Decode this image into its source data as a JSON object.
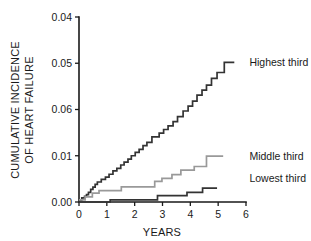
{
  "chart_data": {
    "type": "line",
    "title": "",
    "subtitle": "",
    "xlabel": "YEARS",
    "ylabel": "CUMULATIVE INCIDENCE OF HEART FAILURE",
    "ylabel_line1": "CUMULATIVE INCIDENCE",
    "ylabel_line2": "OF HEART FAILURE",
    "grid": false,
    "legend_position": "inline-right-of-curve-end",
    "step_style": "post",
    "xlim": [
      0,
      6
    ],
    "xticks": [
      0,
      1,
      2,
      3,
      4,
      5,
      6
    ],
    "xticklabels": [
      "0",
      "1",
      "2",
      "3",
      "4",
      "5",
      "6"
    ],
    "yticklabels_bottom_to_top": [
      "0.00",
      "0.01",
      "0.06",
      "0.05",
      "0.04"
    ],
    "yticklabels_top_to_bottom": [
      "0.04",
      "0.05",
      "0.06",
      "0.01",
      "0.00"
    ],
    "ytick_positions_fraction_bottom_to_top": [
      0.0,
      0.25,
      0.5,
      0.75,
      1.0
    ],
    "ytick_value_fraction": {
      "0.00": 0.0,
      "0.01": 0.25,
      "0.06": 0.5,
      "0.05": 0.75,
      "0.04": 1.0
    },
    "series": [
      {
        "name": "Highest third",
        "label": "Highest third",
        "color": "#333333",
        "label_x_years": 6.05,
        "label_y_fraction": 0.755,
        "points_years_fraction": [
          [
            0.0,
            0.01
          ],
          [
            0.1,
            0.01
          ],
          [
            0.1,
            0.022
          ],
          [
            0.2,
            0.022
          ],
          [
            0.2,
            0.03
          ],
          [
            0.27,
            0.03
          ],
          [
            0.27,
            0.04
          ],
          [
            0.34,
            0.04
          ],
          [
            0.34,
            0.052
          ],
          [
            0.42,
            0.052
          ],
          [
            0.42,
            0.068
          ],
          [
            0.5,
            0.068
          ],
          [
            0.5,
            0.08
          ],
          [
            0.58,
            0.08
          ],
          [
            0.58,
            0.095
          ],
          [
            0.66,
            0.095
          ],
          [
            0.66,
            0.108
          ],
          [
            0.8,
            0.108
          ],
          [
            0.8,
            0.122
          ],
          [
            0.95,
            0.122
          ],
          [
            0.95,
            0.135
          ],
          [
            1.08,
            0.135
          ],
          [
            1.08,
            0.15
          ],
          [
            1.22,
            0.15
          ],
          [
            1.22,
            0.168
          ],
          [
            1.36,
            0.168
          ],
          [
            1.36,
            0.182
          ],
          [
            1.5,
            0.182
          ],
          [
            1.5,
            0.2
          ],
          [
            1.62,
            0.2
          ],
          [
            1.62,
            0.215
          ],
          [
            1.76,
            0.215
          ],
          [
            1.76,
            0.232
          ],
          [
            1.88,
            0.232
          ],
          [
            1.88,
            0.25
          ],
          [
            2.02,
            0.25
          ],
          [
            2.02,
            0.268
          ],
          [
            2.16,
            0.268
          ],
          [
            2.16,
            0.285
          ],
          [
            2.3,
            0.285
          ],
          [
            2.3,
            0.305
          ],
          [
            2.44,
            0.305
          ],
          [
            2.44,
            0.322
          ],
          [
            2.62,
            0.322
          ],
          [
            2.62,
            0.352
          ],
          [
            2.88,
            0.352
          ],
          [
            2.88,
            0.372
          ],
          [
            3.04,
            0.372
          ],
          [
            3.04,
            0.392
          ],
          [
            3.2,
            0.392
          ],
          [
            3.2,
            0.412
          ],
          [
            3.38,
            0.412
          ],
          [
            3.38,
            0.435
          ],
          [
            3.54,
            0.435
          ],
          [
            3.54,
            0.462
          ],
          [
            3.74,
            0.462
          ],
          [
            3.74,
            0.492
          ],
          [
            3.92,
            0.492
          ],
          [
            3.92,
            0.518
          ],
          [
            4.08,
            0.518
          ],
          [
            4.08,
            0.545
          ],
          [
            4.24,
            0.545
          ],
          [
            4.24,
            0.578
          ],
          [
            4.42,
            0.578
          ],
          [
            4.42,
            0.605
          ],
          [
            4.58,
            0.605
          ],
          [
            4.58,
            0.632
          ],
          [
            4.76,
            0.632
          ],
          [
            4.76,
            0.668
          ],
          [
            4.96,
            0.668
          ],
          [
            4.96,
            0.7
          ],
          [
            5.22,
            0.7
          ],
          [
            5.22,
            0.755
          ],
          [
            5.58,
            0.755
          ]
        ]
      },
      {
        "name": "Middle third",
        "label": "Middle third",
        "color": "#999999",
        "label_x_years": 6.05,
        "label_y_fraction": 0.248,
        "points_years_fraction": [
          [
            0.0,
            0.012
          ],
          [
            0.22,
            0.012
          ],
          [
            0.22,
            0.028
          ],
          [
            0.48,
            0.028
          ],
          [
            0.48,
            0.048
          ],
          [
            0.72,
            0.048
          ],
          [
            0.72,
            0.062
          ],
          [
            1.52,
            0.062
          ],
          [
            1.52,
            0.082
          ],
          [
            2.72,
            0.082
          ],
          [
            2.72,
            0.112
          ],
          [
            2.98,
            0.112
          ],
          [
            2.98,
            0.128
          ],
          [
            3.34,
            0.128
          ],
          [
            3.34,
            0.148
          ],
          [
            3.66,
            0.148
          ],
          [
            3.66,
            0.172
          ],
          [
            4.14,
            0.172
          ],
          [
            4.14,
            0.192
          ],
          [
            4.58,
            0.192
          ],
          [
            4.58,
            0.248
          ],
          [
            5.18,
            0.248
          ]
        ]
      },
      {
        "name": "Lowest third",
        "label": "Lowest third",
        "color": "#333333",
        "label_x_years": 6.05,
        "label_y_fraction": 0.128,
        "points_years_fraction": [
          [
            0.0,
            0.0
          ],
          [
            1.12,
            0.0
          ],
          [
            1.12,
            0.012
          ],
          [
            2.82,
            0.012
          ],
          [
            2.82,
            0.035
          ],
          [
            3.88,
            0.035
          ],
          [
            3.88,
            0.052
          ],
          [
            4.44,
            0.052
          ],
          [
            4.44,
            0.075
          ],
          [
            4.96,
            0.075
          ]
        ]
      }
    ]
  }
}
